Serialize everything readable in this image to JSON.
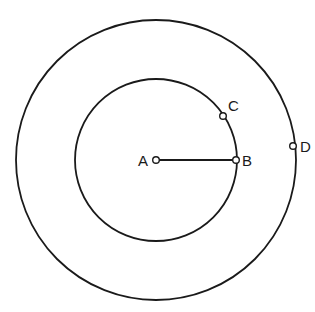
{
  "diagram": {
    "stroke_color": "#1a1a1a",
    "background": "#ffffff",
    "center": {
      "x": 156,
      "y": 160
    },
    "circles": [
      {
        "name": "inner-circle",
        "r": 81
      },
      {
        "name": "outer-circle",
        "r": 140
      }
    ],
    "segments": [
      {
        "name": "radius-AB",
        "from": "A",
        "to": "B"
      }
    ],
    "points": [
      {
        "label": "A",
        "x": 156,
        "y": 160,
        "label_x": 140,
        "label_y": 166
      },
      {
        "label": "B",
        "x": 236,
        "y": 160,
        "label_x": 242,
        "label_y": 166
      },
      {
        "label": "C",
        "x": 223,
        "y": 116,
        "label_x": 228,
        "label_y": 111
      },
      {
        "label": "D",
        "x": 293,
        "y": 145,
        "label_x": 300,
        "label_y": 151
      }
    ]
  }
}
